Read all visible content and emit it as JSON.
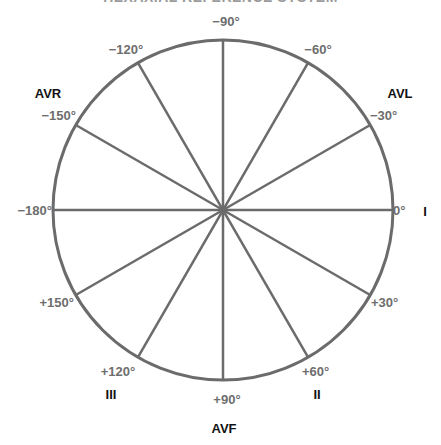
{
  "title": "HEXAXIAL REFERENCE SYSTEM",
  "colors": {
    "line": "#6b6b6b",
    "angle_label": "#6e6e6e",
    "lead_label": "#111111",
    "background": "#ffffff"
  },
  "circle": {
    "cx": 223,
    "cy": 210,
    "r": 170
  },
  "angles": [
    {
      "deg": 0,
      "label": "0°",
      "x": 393,
      "y": 215,
      "anchor": "start"
    },
    {
      "deg": 30,
      "label": "+30°",
      "x": 371,
      "y": 307,
      "anchor": "start"
    },
    {
      "deg": 60,
      "label": "+60°",
      "x": 302,
      "y": 376,
      "anchor": "start"
    },
    {
      "deg": 90,
      "label": "+90°",
      "x": 227,
      "y": 404,
      "anchor": "middle"
    },
    {
      "deg": 120,
      "label": "+120°",
      "x": 118,
      "y": 376,
      "anchor": "middle"
    },
    {
      "deg": 150,
      "label": "+150°",
      "x": 74,
      "y": 307,
      "anchor": "end"
    },
    {
      "deg": 180,
      "label": "−180°",
      "x": 52,
      "y": 215,
      "anchor": "end"
    },
    {
      "deg": -150,
      "label": "−150°",
      "x": 76,
      "y": 120,
      "anchor": "end"
    },
    {
      "deg": -120,
      "label": "−120°",
      "x": 126,
      "y": 54,
      "anchor": "middle"
    },
    {
      "deg": -90,
      "label": "−90°",
      "x": 226,
      "y": 26,
      "anchor": "middle"
    },
    {
      "deg": -60,
      "label": "−60°",
      "x": 318,
      "y": 54,
      "anchor": "middle"
    },
    {
      "deg": -30,
      "label": "−30°",
      "x": 370,
      "y": 120,
      "anchor": "start"
    }
  ],
  "leads": [
    {
      "label": "I",
      "x": 425,
      "y": 216
    },
    {
      "label": "II",
      "x": 317,
      "y": 399
    },
    {
      "label": "III",
      "x": 111,
      "y": 399
    },
    {
      "label": "AVF",
      "x": 224,
      "y": 433
    },
    {
      "label": "AVR",
      "x": 48,
      "y": 98
    },
    {
      "label": "AVL",
      "x": 400,
      "y": 98
    }
  ]
}
